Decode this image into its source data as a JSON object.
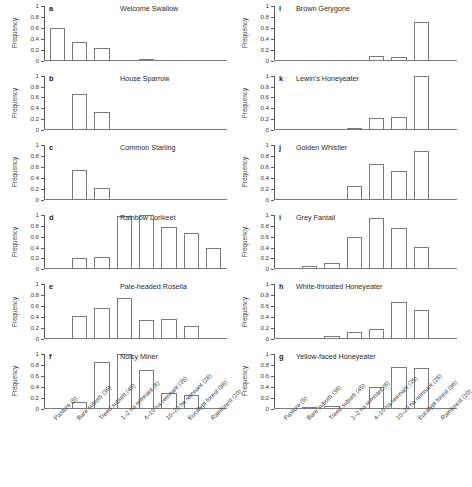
{
  "chart_data": {
    "type": "bar",
    "title": "",
    "xlabel": "",
    "ylabel": "Frequency",
    "ylim": [
      0,
      1
    ],
    "yticks": [
      "0",
      "0.2",
      "0.4",
      "0.6",
      "0.8",
      "1"
    ],
    "ytick_values": [
      0,
      0.2,
      0.4,
      0.6,
      0.8,
      1
    ],
    "grid": false,
    "legend": "none",
    "categories": [
      "Pasture (5)",
      "Bare suburb (36)",
      "Treed suburb (45)",
      "1–2 ha remnant (8)",
      "4–10 ha remnant (35)",
      "10–20 ha remnant (28)",
      "Eucalypt forest (96)",
      "Rainforest (10)"
    ],
    "panels": [
      {
        "letter": "a",
        "name": "Welcome Swallow",
        "column": "left",
        "values": [
          0.6,
          0.34,
          0.24,
          0,
          0.03,
          0,
          0,
          0
        ]
      },
      {
        "letter": "b",
        "name": "House Sparrow",
        "column": "left",
        "values": [
          0,
          0.67,
          0.34,
          0,
          0,
          0,
          0,
          0
        ]
      },
      {
        "letter": "c",
        "name": "Common Starling",
        "column": "left",
        "values": [
          0,
          0.54,
          0.21,
          0,
          0,
          0,
          0,
          0
        ]
      },
      {
        "letter": "d",
        "name": "Rainbow Lorikeet",
        "column": "left",
        "values": [
          0,
          0.2,
          0.22,
          0.98,
          1.0,
          0.77,
          0.67,
          0.4
        ]
      },
      {
        "letter": "e",
        "name": "Pale-headed Rosella",
        "column": "left",
        "values": [
          0,
          0.42,
          0.56,
          0.75,
          0.34,
          0.36,
          0.23,
          0
        ]
      },
      {
        "letter": "f",
        "name": "Noisy Miner",
        "column": "left",
        "values": [
          0,
          0.12,
          0.86,
          1.0,
          0.7,
          0.29,
          0.24,
          0
        ]
      },
      {
        "letter": "l",
        "name": "Brown Gerygone",
        "column": "right",
        "values": [
          0,
          0,
          0,
          0,
          0.08,
          0.06,
          0.7,
          0
        ]
      },
      {
        "letter": "k",
        "name": "Lewin's Honeyeater",
        "column": "right",
        "values": [
          0,
          0,
          0,
          0.03,
          0.22,
          0.25,
          1.0,
          0
        ]
      },
      {
        "letter": "j",
        "name": "Golden Whistler",
        "column": "right",
        "values": [
          0,
          0,
          0,
          0.26,
          0.65,
          0.53,
          0.89,
          0
        ]
      },
      {
        "letter": "i",
        "name": "Grey Fantail",
        "column": "right",
        "values": [
          0,
          0.07,
          0.12,
          0.6,
          0.94,
          0.76,
          0.41,
          0
        ]
      },
      {
        "letter": "h",
        "name": "White-throated Honeyeater",
        "column": "right",
        "values": [
          0,
          0,
          0.05,
          0.12,
          0.19,
          0.68,
          0.54,
          0
        ]
      },
      {
        "letter": "g",
        "name": "Yellow-faced Honeyeater",
        "column": "right",
        "values": [
          0,
          0.02,
          0.04,
          0,
          0.4,
          0.76,
          0.74,
          0
        ]
      }
    ]
  }
}
